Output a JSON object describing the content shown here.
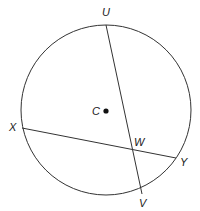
{
  "diagram": {
    "circle": {
      "center_label": "C",
      "cx": 106,
      "cy": 110,
      "r": 85
    },
    "points": [
      {
        "name": "U",
        "x": 106,
        "y": 25,
        "label_x": 102,
        "label_y": 16
      },
      {
        "name": "V",
        "x": 142,
        "y": 194,
        "label_x": 139,
        "label_y": 207
      },
      {
        "name": "X",
        "x": 22,
        "y": 128,
        "label_x": 9,
        "label_y": 131
      },
      {
        "name": "Y",
        "x": 176,
        "y": 158,
        "label_x": 180,
        "label_y": 166
      },
      {
        "name": "W",
        "x": 133,
        "y": 149,
        "label_x": 134,
        "label_y": 146
      },
      {
        "name": "C",
        "x": 106,
        "y": 111,
        "label_x": 92,
        "label_y": 115
      }
    ],
    "chords": [
      {
        "name": "UV",
        "from": "U",
        "to": "V"
      },
      {
        "name": "XY",
        "from": "X",
        "to": "Y"
      }
    ],
    "labels": {
      "U": "U",
      "V": "V",
      "X": "X",
      "Y": "Y",
      "W": "W",
      "C": "C"
    },
    "stroke_color": "#333333"
  }
}
